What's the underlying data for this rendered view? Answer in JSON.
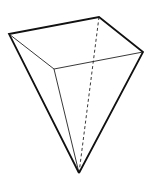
{
  "diagram": {
    "type": "inverted-square-pyramid",
    "vertices": {
      "left": [
        9,
        34
      ],
      "back": [
        99,
        17
      ],
      "right": [
        143,
        52
      ],
      "front": [
        54,
        69
      ],
      "apex": [
        79,
        173
      ]
    },
    "stroke_color": "#111111",
    "background": "#ffffff"
  }
}
